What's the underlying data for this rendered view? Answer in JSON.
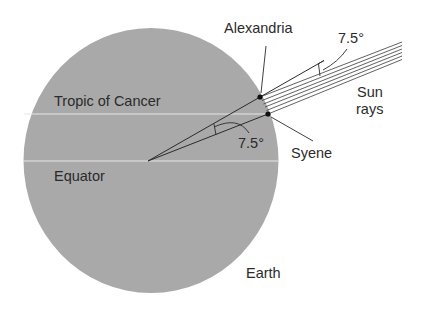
{
  "diagram": {
    "type": "eratosthenes-earth-circumference",
    "colors": {
      "earth_fill": "#a9a9a9",
      "latitude_lines": "#e6e6e6",
      "ink": "#2b2b2b",
      "background": "#ffffff"
    },
    "labels": {
      "alexandria": "Alexandria",
      "syene": "Syene",
      "tropic": "Tropic of Cancer",
      "equator": "Equator",
      "earth": "Earth",
      "sun": "Sun",
      "rays": "rays",
      "angle_top": "7.5°",
      "angle_center": "7.5°"
    },
    "angle_degrees": 7.5,
    "sun_ray_count": 6
  }
}
